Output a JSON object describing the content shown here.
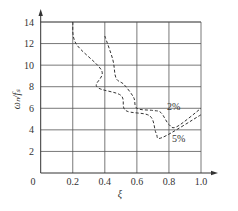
{
  "chart_data": {
    "type": "line",
    "title": "",
    "xlabel": "ξ",
    "ylabel": "ωₙ/fₛ",
    "xlim": [
      0,
      1.0
    ],
    "ylim": [
      0,
      14
    ],
    "x_ticks": [
      "0",
      "0.2",
      "0.4",
      "0.6",
      "0.8",
      "1.0"
    ],
    "y_ticks": [
      "2",
      "4",
      "6",
      "8",
      "10",
      "12",
      "14"
    ],
    "grid": true,
    "series": [
      {
        "name": "2%",
        "style": "dashed",
        "points": [
          [
            0.4,
            12.7
          ],
          [
            0.45,
            10.5
          ],
          [
            0.47,
            8.8
          ],
          [
            0.52,
            8.2
          ],
          [
            0.58,
            7.0
          ],
          [
            0.6,
            6.0
          ],
          [
            0.7,
            5.8
          ],
          [
            0.75,
            5.6
          ],
          [
            0.8,
            4.5
          ],
          [
            0.85,
            4.3
          ],
          [
            1.0,
            6.0
          ]
        ]
      },
      {
        "name": "5%",
        "style": "dashed",
        "points": [
          [
            0.2,
            14.0
          ],
          [
            0.22,
            12.0
          ],
          [
            0.38,
            9.5
          ],
          [
            0.35,
            8.0
          ],
          [
            0.5,
            7.2
          ],
          [
            0.53,
            5.8
          ],
          [
            0.68,
            5.3
          ],
          [
            0.72,
            3.7
          ],
          [
            0.76,
            3.3
          ],
          [
            1.0,
            5.4
          ]
        ]
      }
    ],
    "annotations": [
      {
        "text": "2%",
        "x": 0.83,
        "y": 5.8
      },
      {
        "text": "5%",
        "x": 0.86,
        "y": 2.9
      }
    ]
  },
  "axis": {
    "origin_label": "0"
  }
}
